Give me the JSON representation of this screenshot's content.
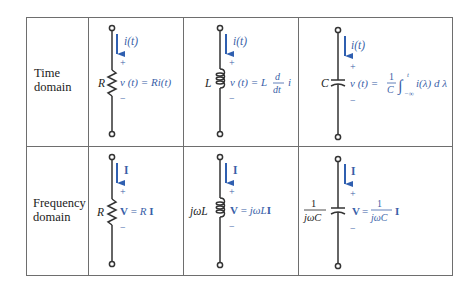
{
  "table": {
    "rows": [
      {
        "label_line1": "Time",
        "label_line2": "domain",
        "resistor": {
          "current": "i(t)",
          "element_label": "R",
          "plus": "+",
          "minus": "−",
          "equation": "v(t) = Ri(t)"
        },
        "inductor": {
          "current": "i(t)",
          "element_label": "L",
          "plus": "+",
          "minus": "−",
          "equation": "v(t) = L d/dt i"
        },
        "capacitor": {
          "current": "i(t)",
          "element_label": "C",
          "plus": "+",
          "minus": "−",
          "equation": "v(t) = 1/C ∫_{−∞}^{t} i(λ) dλ"
        }
      },
      {
        "label_line1": "Frequency",
        "label_line2": "domain",
        "resistor": {
          "current": "I",
          "element_label": "R",
          "plus": "+",
          "minus": "−",
          "equation": "V = RI"
        },
        "inductor": {
          "current": "I",
          "element_label": "jωL",
          "plus": "+",
          "minus": "−",
          "equation": "V = jωLI"
        },
        "capacitor": {
          "current": "I",
          "element_label": "1/(jωC)",
          "plus": "+",
          "minus": "−",
          "equation": "V = 1/(jωC) I"
        }
      }
    ]
  },
  "colors": {
    "accent_blue": "#3a5fa8",
    "line": "#6e6e6e",
    "wire": "#333333"
  }
}
